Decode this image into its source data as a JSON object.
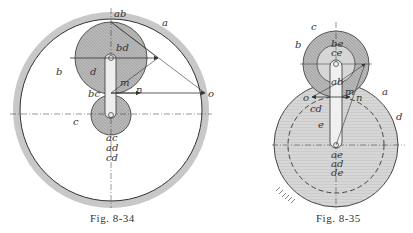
{
  "figures": [
    {
      "caption": "Fig. 8-34",
      "labels": {
        "ab": "ab",
        "a": "a",
        "bd": "bd",
        "b": "b",
        "d": "d",
        "m": "m",
        "bc": "bc",
        "n": "n",
        "o": "o",
        "c": "c",
        "ac": "ac",
        "ad": "ad",
        "cd": "cd"
      }
    },
    {
      "caption": "Fig. 8-35",
      "labels": {
        "c": "c",
        "b": "b",
        "be": "be",
        "ce": "ce",
        "ab": "ab",
        "o": "o",
        "m": "m",
        "n": "n",
        "a": "a",
        "cd": "cd",
        "d": "d",
        "e": "e",
        "ae": "ae",
        "ad": "ad",
        "de": "de"
      }
    }
  ],
  "colors": {
    "line": "#333333",
    "shade_dark": "#9a9a9a",
    "shade_mid": "#bdbdbd",
    "shade_light": "#d9d9d9",
    "rim": "#c8c8c8"
  }
}
